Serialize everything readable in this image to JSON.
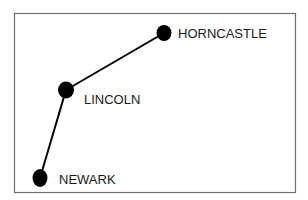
{
  "diagram": {
    "type": "route-map",
    "frame": {
      "x": 14,
      "y": 13,
      "width": 281,
      "height": 179,
      "stroke": "#6e6e6e"
    },
    "line_color": "#000000",
    "node_color": "#000000",
    "label_color": "#1a1a1a",
    "nodes": [
      {
        "id": "horncastle",
        "label": "HORNCASTLE",
        "cx": 164,
        "cy": 33,
        "rx": 7.5,
        "ry": 8,
        "label_x": 178,
        "label_y": 38
      },
      {
        "id": "lincoln",
        "label": "LINCOLN",
        "cx": 66,
        "cy": 90,
        "rx": 8,
        "ry": 8.5,
        "label_x": 84,
        "label_y": 104
      },
      {
        "id": "newark",
        "label": "NEWARK",
        "cx": 40,
        "cy": 178,
        "rx": 7.5,
        "ry": 9,
        "label_x": 59,
        "label_y": 184
      }
    ],
    "edges": [
      {
        "from": "horncastle",
        "to": "lincoln"
      },
      {
        "from": "lincoln",
        "to": "newark"
      }
    ]
  }
}
